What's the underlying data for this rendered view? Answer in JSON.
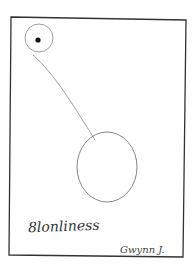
{
  "drawing": {
    "caption": "8lonliness",
    "signature": "Gwynn J.",
    "ink_color": "#333333",
    "paper_color": "#ffffff"
  }
}
